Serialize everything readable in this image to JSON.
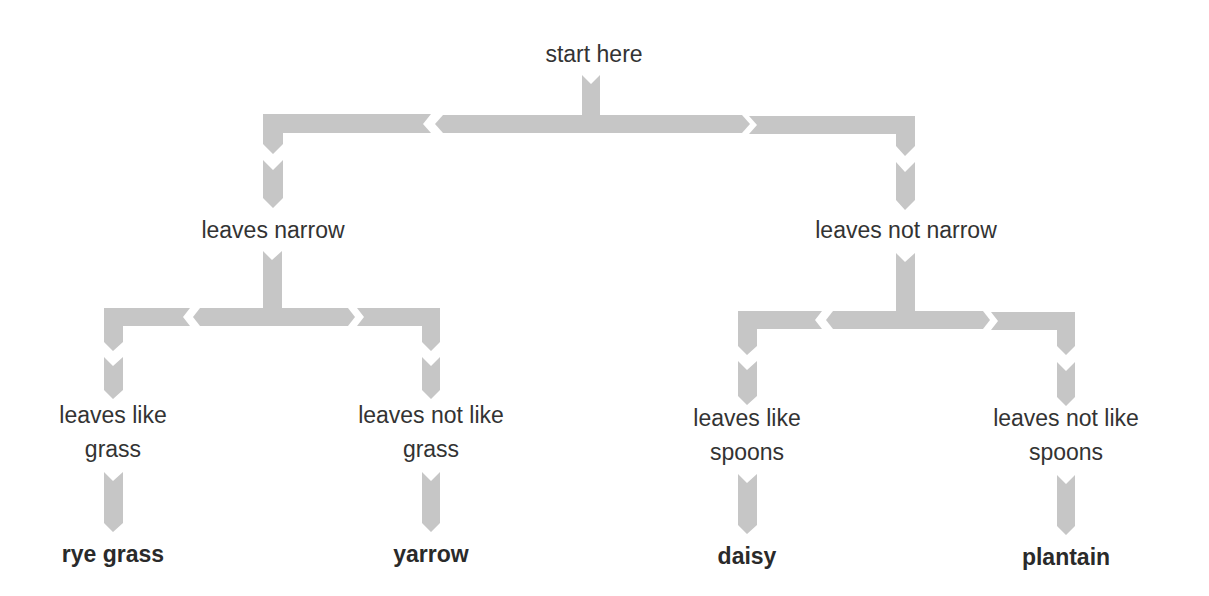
{
  "diagram": {
    "type": "dichotomous-key",
    "arrow_color": "#c6c6c6",
    "text_color": "#333333",
    "root": {
      "label": "start here"
    },
    "level1": {
      "left": {
        "label": "leaves narrow"
      },
      "right": {
        "label": "leaves not narrow"
      }
    },
    "level2": {
      "left_left": {
        "line1": "leaves like",
        "line2": "grass"
      },
      "left_right": {
        "line1": "leaves not like",
        "line2": "grass"
      },
      "right_left": {
        "line1": "leaves like",
        "line2": "spoons"
      },
      "right_right": {
        "line1": "leaves not like",
        "line2": "spoons"
      }
    },
    "results": {
      "left_left": "rye grass",
      "left_right": "yarrow",
      "right_left": "daisy",
      "right_right": "plantain"
    }
  }
}
